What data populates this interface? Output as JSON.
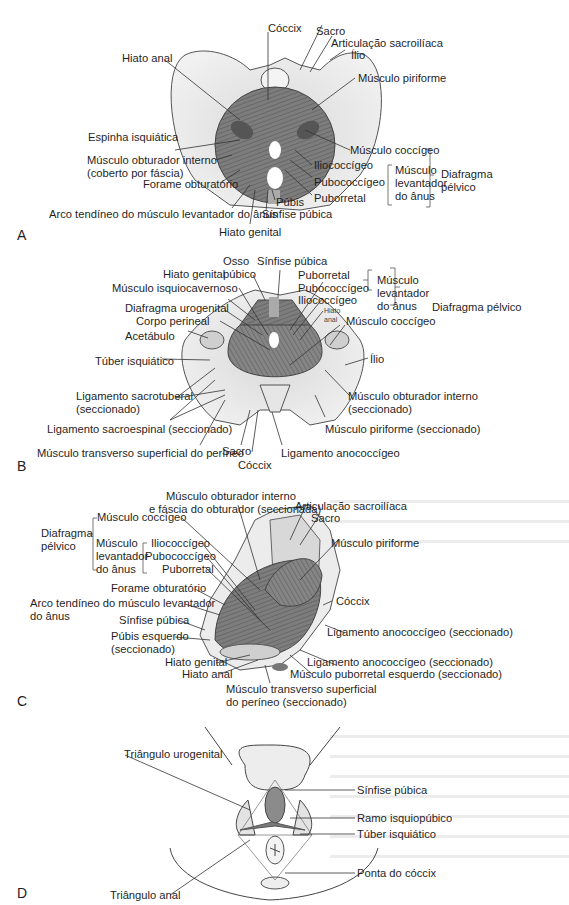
{
  "figure": {
    "panels": [
      {
        "id": "A",
        "letter": "A",
        "labels": {
          "coccix": "Cóccix",
          "sacro": "Sacro",
          "articulacao": "Articulação sacroilíaca",
          "ilio": "Ílio",
          "hiato_anal": "Hiato anal",
          "piriforme": "Músculo piriforme",
          "espinha": "Espinha isquiática",
          "coccigeo": "Músculo coccígeo",
          "obturador_1": "Músculo obturador interno",
          "obturador_2": "(coberto por fáscia)",
          "iliococcigeo": "Iliococcígeo",
          "pubococcigeo": "Pubococcígeo",
          "puborretal": "Puborretal",
          "levantador_1": "Músculo",
          "levantador_2": "levantador",
          "levantador_3": "do ânus",
          "diafragma_1": "Diafragma",
          "diafragma_2": "pélvico",
          "forame": "Forame obturatório",
          "pubis": "Púbis",
          "arco": "Arco tendíneo do músculo levantador do ânus",
          "sinfise": "Sínfise púbica",
          "hiato_genital": "Hiato genital"
        }
      },
      {
        "id": "B",
        "letter": "B",
        "labels": {
          "osso_1": "Osso",
          "osso_2": "púbico",
          "sinfise": "Sínfise púbica",
          "hiato_genital": "Hiato genital",
          "puborretal": "Puborretal",
          "isquiocavernoso": "Músculo isquiocavernoso",
          "pubococcigeo": "Pubococcígeo",
          "iliococcigeo": "Iliococcígeo",
          "levantador_1": "Músculo",
          "levantador_2": "levantador",
          "levantador_3": "do ânus",
          "diafragma": "Diafragma pélvico",
          "urogenital": "Diafragma urogenital",
          "hiato_anal_1": "Hiato",
          "hiato_anal_2": "anal",
          "corpo": "Corpo perineal",
          "coccigeo": "Músculo coccígeo",
          "acetabulo": "Acetábulo",
          "tuber": "Túber isquiático",
          "ilio": "Ílio",
          "sacrotuberal_1": "Ligamento sacrotuberal",
          "sacrotuberal_2": "(seccionado)",
          "obturador_1": "Músculo obturador interno",
          "obturador_2": "(seccionado)",
          "sacroespinal": "Ligamento sacroespinal (seccionado)",
          "piriforme": "Músculo piriforme (seccionado)",
          "transverso": "Músculo transverso superficial do períneo",
          "sacro": "Sacro",
          "anococcigeo": "Ligamento anococcígeo",
          "coccix": "Cóccix"
        }
      },
      {
        "id": "C",
        "letter": "C",
        "labels": {
          "obturador_1": "Músculo obturador interno",
          "obturador_2": "e fáscia do obturador (seccionada)",
          "articulacao": "Articulação sacroilíaca",
          "sacro": "Sacro",
          "coccigeo": "Músculo coccígeo",
          "diafragma_1": "Diafragma",
          "diafragma_2": "pélvico",
          "levantador_1": "Músculo",
          "levantador_2": "levantador",
          "levantador_3": "do ânus",
          "iliococcigeo": "Iliococcígeo",
          "pubococcigeo": "Pubococcígeo",
          "puborretal": "Puborretal",
          "piriforme": "Músculo piriforme",
          "forame": "Forame obturatório",
          "arco_1": "Arco tendíneo do músculo levantador",
          "arco_2": "do ânus",
          "coccix": "Cóccix",
          "sinfise": "Sínfise púbica",
          "anococcigeo_1": "Ligamento anococcígeo (seccionado)",
          "pubis_1": "Púbis esquerdo",
          "pubis_2": "(seccionado)",
          "hiato_genital": "Hiato genital",
          "anococcigeo_2": "Ligamento anococcígeo (seccionado)",
          "hiato_anal": "Hiato anal",
          "puborretal_esq": "Músculo puborretal esquerdo (seccionado)",
          "transverso_1": "Músculo transverso superficial",
          "transverso_2": "do períneo (seccionado)"
        }
      },
      {
        "id": "D",
        "letter": "D",
        "labels": {
          "urogenital": "Triângulo urogenital",
          "sinfise": "Sínfise púbica",
          "ramo": "Ramo isquiopúbico",
          "tuber": "Túber isquiático",
          "ponta": "Ponta do cóccix",
          "anal": "Triângulo anal"
        }
      }
    ]
  },
  "colors": {
    "bone": "#ededed",
    "muscle": "#8a8a8a",
    "line": "#444444"
  }
}
